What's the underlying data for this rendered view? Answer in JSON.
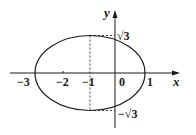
{
  "diagram": {
    "axes": {
      "x_label": "x",
      "y_label": "y"
    },
    "x_ticks": [
      "−3",
      "−2",
      "−1",
      "0",
      "1"
    ],
    "y_ticks": [
      "√3",
      "−√3"
    ],
    "ellipse": {
      "center": [
        -1,
        0
      ],
      "semi_axis_x": 2,
      "semi_axis_y": "√3"
    },
    "dashed_guide": {
      "x": -1,
      "from": "−√3",
      "to": "√3"
    },
    "colors": {
      "stroke": "#1a1a1a"
    }
  }
}
